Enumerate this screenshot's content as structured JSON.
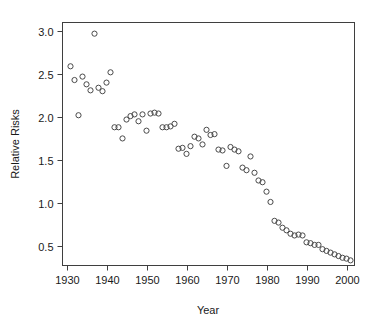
{
  "chart_data": {
    "type": "scatter",
    "title": "",
    "xlabel": "Year",
    "ylabel": "Relative Risks",
    "xlim": [
      1929,
      2002
    ],
    "ylim": [
      0.27,
      3.1
    ],
    "grid": false,
    "legend": null,
    "marker": "open-circle",
    "xticks": [
      1930,
      1940,
      1950,
      1960,
      1970,
      1980,
      1990,
      2000
    ],
    "xtick_labels": [
      "1930",
      "1940",
      "1950",
      "1960",
      "1970",
      "1980",
      "1990",
      "2000"
    ],
    "yticks": [
      0.5,
      1.0,
      1.5,
      2.0,
      2.5,
      3.0
    ],
    "ytick_labels": [
      "0.5",
      "1.0",
      "1.5",
      "2.0",
      "2.5",
      "3.0"
    ],
    "x": [
      1931,
      1932,
      1933,
      1934,
      1935,
      1936,
      1937,
      1938,
      1939,
      1940,
      1941,
      1942,
      1943,
      1944,
      1945,
      1946,
      1947,
      1948,
      1949,
      1950,
      1951,
      1952,
      1953,
      1954,
      1955,
      1956,
      1957,
      1958,
      1959,
      1960,
      1961,
      1962,
      1963,
      1964,
      1965,
      1966,
      1967,
      1968,
      1969,
      1970,
      1971,
      1972,
      1973,
      1974,
      1975,
      1976,
      1977,
      1978,
      1979,
      1980,
      1981,
      1982,
      1983,
      1984,
      1985,
      1986,
      1987,
      1988,
      1989,
      1990,
      1991,
      1992,
      1993,
      1994,
      1995,
      1996,
      1997,
      1998,
      1999,
      2000,
      2001
    ],
    "y": [
      2.59,
      2.43,
      2.02,
      2.47,
      2.38,
      2.31,
      2.97,
      2.34,
      2.3,
      2.4,
      2.52,
      1.88,
      1.88,
      1.75,
      1.97,
      2.01,
      2.03,
      1.95,
      2.03,
      1.84,
      2.04,
      2.05,
      2.04,
      1.88,
      1.88,
      1.89,
      1.92,
      1.63,
      1.64,
      1.57,
      1.66,
      1.77,
      1.75,
      1.68,
      1.85,
      1.79,
      1.8,
      1.62,
      1.61,
      1.43,
      1.65,
      1.62,
      1.6,
      1.41,
      1.38,
      1.54,
      1.35,
      1.26,
      1.24,
      1.13,
      1.01,
      0.79,
      0.77,
      0.71,
      0.68,
      0.64,
      0.62,
      0.63,
      0.62,
      0.54,
      0.53,
      0.51,
      0.51,
      0.46,
      0.44,
      0.42,
      0.4,
      0.38,
      0.36,
      0.35,
      0.33
    ],
    "n_points": 71
  },
  "axes": {
    "x_title": "Year",
    "y_title": "Relative Risks"
  }
}
